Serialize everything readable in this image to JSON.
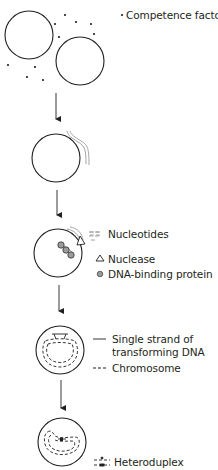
{
  "colors": {
    "outline": "#231f20",
    "transforming_dna": "#9a9a9a",
    "protein": "#9b9b9b",
    "background": "#ffffff"
  },
  "steps": [
    {
      "id": 1,
      "description": "Two cells with competence factor molecules in surrounding medium"
    },
    {
      "id": 2,
      "description": "Transforming DNA strands attach to cell surface"
    },
    {
      "id": 3,
      "description": "Nuclease degrades one strand into nucleotides; DNA-binding proteins bind entering strand"
    },
    {
      "id": 4,
      "description": "Single strand of transforming DNA aligns with chromosome"
    },
    {
      "id": 5,
      "description": "Heteroduplex formed in chromosome"
    }
  ],
  "legend": {
    "competence_factor": {
      "symbol": "dot",
      "label": "Competence factor"
    },
    "nucleotides": {
      "symbol": "short-dashes",
      "label": "Nucleotides"
    },
    "nuclease": {
      "symbol": "triangle",
      "label": "Nuclease"
    },
    "dna_binding_protein": {
      "symbol": "gray-circle",
      "label": "DNA-binding protein"
    },
    "single_strand_line1": "Single strand of",
    "single_strand_line2": "transforming DNA",
    "single_strand_symbol": "solid-line",
    "chromosome": {
      "symbol": "dashed-line",
      "label": "Chromosome"
    },
    "heteroduplex": {
      "symbol": "dashed-pair-with-marker",
      "label": "Heteroduplex"
    }
  },
  "symbols": {
    "bullet": "•",
    "triangle": "△"
  }
}
